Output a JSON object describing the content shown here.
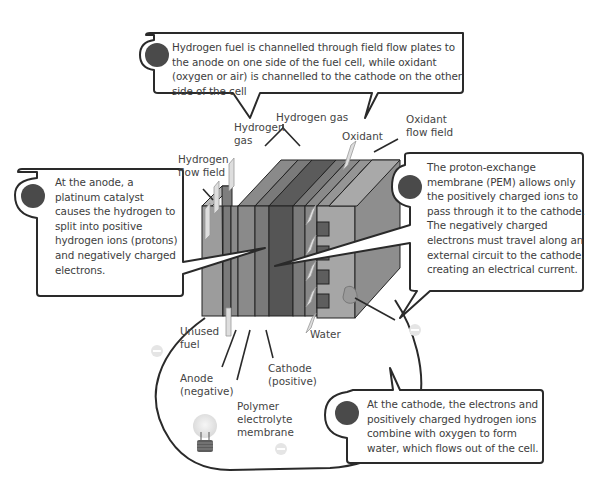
{
  "callouts": {
    "top": "Hydrogen fuel is channelled through field flow plates to the anode on one side of the fuel cell, while oxidant (oxygen or air) is channelled to the cathode on the other side of the cell",
    "left": "At the anode, a platinum catalyst causes the hydrogen to split into positive hydrogen ions (protons) and negatively charged electrons.",
    "right": "The proton-exchange membrane (PEM) allows only the positively charged ions to pass through it to the cathode. The negatively charged electrons must travel along an external circuit to the cathode, creating an electrical current.",
    "bottom": "At the cathode, the electrons and positively charged hydrogen ions combine with oxygen to form water, which flows out of the cell."
  },
  "labels": {
    "hydrogen_gas_top": "Hydrogen gas",
    "hydrogen_gas_left_1": "Hydrogen",
    "hydrogen_gas_left_2": "gas",
    "oxidant": "Oxidant",
    "oxidant_flow_field_1": "Oxidant",
    "oxidant_flow_field_2": "flow field",
    "hydrogen_flow_field_1": "Hydrogen",
    "hydrogen_flow_field_2": "flow field",
    "unused_fuel_1": "Unused",
    "unused_fuel_2": "fuel",
    "water": "Water",
    "anode_1": "Anode",
    "anode_2": "(negative)",
    "cathode_1": "Cathode",
    "cathode_2": "(positive)",
    "polymer_1": "Polymer",
    "polymer_2": "electrolyte",
    "polymer_3": "membrane"
  },
  "colors": {
    "outline": "#2a2a2a",
    "bullet": "#4a4a4a",
    "plate_light": "#9a9a9a",
    "plate_mid": "#7d7d7d",
    "plate_dark": "#5a5a5a",
    "arrow": "#d8d8d8"
  }
}
